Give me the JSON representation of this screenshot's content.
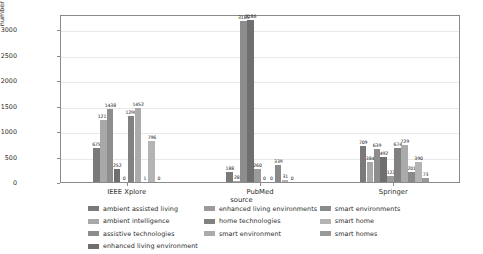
{
  "chart_data": {
    "type": "bar",
    "title": "",
    "subtitle": "",
    "xlabel": "source",
    "ylabel": "number of relevant articles",
    "categories": [
      "IEEE Xplore",
      "PubMed",
      "Springer"
    ],
    "ylim": [
      0,
      3300
    ],
    "yticks": [
      0,
      500,
      1000,
      1500,
      2000,
      2500,
      3000
    ],
    "ytick_labels": [
      "0",
      "500",
      "1000",
      "1500",
      "2000",
      "2500",
      "3000"
    ],
    "grid": true,
    "legend_position": "below-axes",
    "series": [
      {
        "name": "ambient assisted living",
        "color": "#7a7a7a",
        "values": [
          675,
          188,
          709
        ]
      },
      {
        "name": "ambient intelligence",
        "color": "#a8a8a8",
        "values": [
          1211,
          28,
          384
        ]
      },
      {
        "name": "assistive technologies",
        "color": "#8d8d8d",
        "values": [
          1438,
          3165,
          639
        ]
      },
      {
        "name": "enhanced living environment",
        "color": "#6f6f6f",
        "values": [
          252,
          3186,
          492
        ]
      },
      {
        "name": "enhanced living environments",
        "color": "#9b9b9b",
        "values": [
          0,
          260,
          122
        ]
      },
      {
        "name": "home technologies",
        "color": "#818181",
        "values": [
          1298,
          0,
          674
        ]
      },
      {
        "name": "smart environment",
        "color": "#ababab",
        "values": [
          1452,
          0,
          729
        ]
      },
      {
        "name": "smart environments",
        "color": "#8a8a8a",
        "values": [
          1,
          339,
          201
        ]
      },
      {
        "name": "smart home",
        "color": "#b4b4b4",
        "values": [
          796,
          31,
          390
        ]
      },
      {
        "name": "smart homes",
        "color": "#999999",
        "values": [
          0,
          0,
          73
        ]
      }
    ]
  },
  "legend": {
    "columns": [
      [
        "ambient assisted living",
        "ambient intelligence",
        "assistive technologies",
        "enhanced living environment"
      ],
      [
        "enhanced living environments",
        "home technologies",
        "smart environment"
      ],
      [
        "smart environments",
        "smart home",
        "smart homes"
      ]
    ]
  }
}
